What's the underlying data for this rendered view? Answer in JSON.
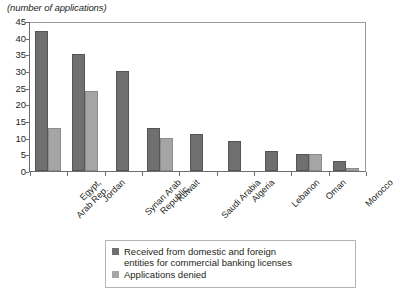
{
  "chart_data": {
    "type": "bar",
    "title": "",
    "subtitle": "(number of applications)",
    "xlabel": "",
    "ylabel": "",
    "ylim": [
      0,
      45
    ],
    "yticks": [
      0,
      5,
      10,
      15,
      20,
      25,
      30,
      35,
      40,
      45
    ],
    "grid": false,
    "legend_position": "bottom",
    "categories": [
      "Egypt,\nArab Rep.",
      "Jordan",
      "Syrian Arab\nRepublic",
      "Kuwait",
      "Saudi Arabia",
      "Algeria",
      "Lebanon",
      "Oman",
      "Morocco"
    ],
    "series": [
      {
        "name": "Received from domestic and foreign entities for commercial banking licenses",
        "color": "#6f6f6f",
        "values": [
          42,
          35,
          30,
          13,
          11,
          9,
          6,
          5,
          3
        ]
      },
      {
        "name": "Applications denied",
        "color": "#a5a5a5",
        "values": [
          13,
          24,
          null,
          10,
          null,
          null,
          null,
          5,
          1
        ]
      }
    ]
  },
  "subtitle": "(number of applications)",
  "axis": {
    "y_ticks": [
      "45",
      "40",
      "35",
      "30",
      "25",
      "20",
      "15",
      "10",
      "5",
      "0"
    ],
    "x_labels": [
      {
        "line1": "Egypt,",
        "line2": "Arab Rep."
      },
      {
        "line1": "Jordan",
        "line2": ""
      },
      {
        "line1": "Syrian Arab",
        "line2": "Republic"
      },
      {
        "line1": "Kuwait",
        "line2": ""
      },
      {
        "line1": "Saudi Arabia",
        "line2": ""
      },
      {
        "line1": "Algeria",
        "line2": ""
      },
      {
        "line1": "Lebanon",
        "line2": ""
      },
      {
        "line1": "Oman",
        "line2": ""
      },
      {
        "line1": "Morocco",
        "line2": ""
      }
    ]
  },
  "legend": {
    "items": [
      {
        "line1": "Received from domestic and foreign",
        "line2": "entities for commercial banking licenses",
        "swatch": "#6f6f6f"
      },
      {
        "line1": "Applications denied",
        "line2": "",
        "swatch": "#a5a5a5"
      }
    ]
  }
}
